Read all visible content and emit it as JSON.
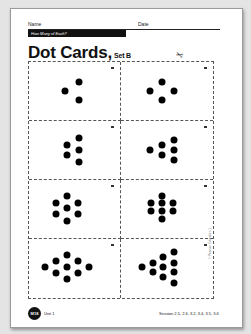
{
  "header": {
    "name_label": "Name",
    "date_label": "Date",
    "banner": "How Many of Each?"
  },
  "title": {
    "main": "Dot Cards,",
    "sub": "Set B"
  },
  "icons": {
    "scissors": "✂"
  },
  "cards": [
    {
      "count": 3,
      "dots": [
        [
          55,
          35
        ],
        [
          40,
          50
        ],
        [
          55,
          65
        ]
      ]
    },
    {
      "count": 4,
      "dots": [
        [
          45,
          35
        ],
        [
          32,
          50
        ],
        [
          58,
          50
        ],
        [
          45,
          65
        ]
      ]
    },
    {
      "count": 5,
      "dots": [
        [
          55,
          30
        ],
        [
          42,
          42
        ],
        [
          55,
          50
        ],
        [
          42,
          58
        ],
        [
          55,
          70
        ]
      ]
    },
    {
      "count": 6,
      "dots": [
        [
          58,
          32
        ],
        [
          45,
          42
        ],
        [
          58,
          50
        ],
        [
          32,
          50
        ],
        [
          45,
          58
        ],
        [
          58,
          68
        ]
      ]
    },
    {
      "count": 7,
      "dots": [
        [
          42,
          28
        ],
        [
          30,
          39
        ],
        [
          54,
          39
        ],
        [
          42,
          49
        ],
        [
          30,
          59
        ],
        [
          54,
          59
        ],
        [
          42,
          70
        ]
      ]
    },
    {
      "count": 8,
      "dots": [
        [
          45,
          28
        ],
        [
          33,
          40
        ],
        [
          45,
          40
        ],
        [
          57,
          40
        ],
        [
          33,
          54
        ],
        [
          45,
          54
        ],
        [
          57,
          54
        ],
        [
          45,
          68
        ]
      ]
    },
    {
      "count": 9,
      "dots": [
        [
          42,
          27
        ],
        [
          30,
          37
        ],
        [
          54,
          37
        ],
        [
          18,
          48
        ],
        [
          42,
          48
        ],
        [
          66,
          48
        ],
        [
          30,
          58
        ],
        [
          54,
          58
        ],
        [
          42,
          68
        ]
      ]
    },
    {
      "count": 10,
      "dots": [
        [
          58,
          22
        ],
        [
          46,
          31
        ],
        [
          35,
          40
        ],
        [
          58,
          40
        ],
        [
          23,
          48
        ],
        [
          46,
          48
        ],
        [
          35,
          56
        ],
        [
          58,
          56
        ],
        [
          46,
          65
        ],
        [
          58,
          74
        ]
      ]
    }
  ],
  "copyright": "© Pearson Education 1",
  "footer": {
    "badge": "M18",
    "unit": "Unit 1",
    "sessions": "Session 2.5, 2.6, 3.2, 3.4, 3.5, 3.6"
  }
}
